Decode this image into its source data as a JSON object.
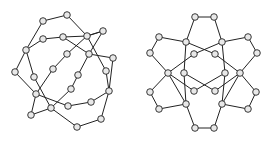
{
  "diagrams": [
    {
      "name": "left-graph",
      "nodes": [
        [
          43,
          21
        ],
        [
          67,
          15
        ],
        [
          87,
          36
        ],
        [
          103,
          31
        ],
        [
          43,
          39
        ],
        [
          63,
          37
        ],
        [
          26,
          50
        ],
        [
          67,
          54
        ],
        [
          89,
          54
        ],
        [
          113,
          58
        ],
        [
          15,
          72
        ],
        [
          53,
          69
        ],
        [
          78,
          75
        ],
        [
          106,
          71
        ],
        [
          34,
          77
        ],
        [
          71,
          89
        ],
        [
          109,
          91
        ],
        [
          36,
          94
        ],
        [
          91,
          102
        ],
        [
          68,
          106
        ],
        [
          51,
          108
        ],
        [
          31,
          115
        ],
        [
          101,
          119
        ],
        [
          77,
          127
        ]
      ],
      "edges": [
        [
          0,
          1
        ],
        [
          1,
          2
        ],
        [
          2,
          3
        ],
        [
          0,
          6
        ],
        [
          4,
          5
        ],
        [
          4,
          6
        ],
        [
          5,
          8
        ],
        [
          6,
          10
        ],
        [
          6,
          14
        ],
        [
          10,
          17
        ],
        [
          2,
          7
        ],
        [
          7,
          11
        ],
        [
          11,
          17
        ],
        [
          3,
          8
        ],
        [
          8,
          12
        ],
        [
          12,
          15
        ],
        [
          15,
          20
        ],
        [
          8,
          9
        ],
        [
          9,
          16
        ],
        [
          2,
          13
        ],
        [
          13,
          16
        ],
        [
          14,
          20
        ],
        [
          17,
          19
        ],
        [
          17,
          21
        ],
        [
          21,
          20
        ],
        [
          19,
          18
        ],
        [
          18,
          16
        ],
        [
          16,
          22
        ],
        [
          22,
          23
        ],
        [
          23,
          20
        ],
        [
          3,
          2
        ],
        [
          5,
          2
        ]
      ]
    },
    {
      "name": "right-graph",
      "nodes": [
        [
          195,
          17
        ],
        [
          214,
          17
        ],
        [
          159,
          37
        ],
        [
          186,
          42
        ],
        [
          222,
          42
        ],
        [
          248,
          37
        ],
        [
          150,
          53
        ],
        [
          194,
          54
        ],
        [
          215,
          54
        ],
        [
          257,
          53
        ],
        [
          168,
          73
        ],
        [
          184,
          73
        ],
        [
          225,
          73
        ],
        [
          240,
          73
        ],
        [
          150,
          92
        ],
        [
          194,
          91
        ],
        [
          215,
          91
        ],
        [
          256,
          92
        ],
        [
          159,
          109
        ],
        [
          186,
          104
        ],
        [
          222,
          104
        ],
        [
          248,
          109
        ],
        [
          195,
          128
        ],
        [
          214,
          128
        ]
      ],
      "edges": [
        [
          0,
          1
        ],
        [
          0,
          3
        ],
        [
          1,
          4
        ],
        [
          2,
          3
        ],
        [
          2,
          6
        ],
        [
          6,
          10
        ],
        [
          3,
          8
        ],
        [
          3,
          11
        ],
        [
          4,
          7
        ],
        [
          4,
          12
        ],
        [
          4,
          5
        ],
        [
          5,
          9
        ],
        [
          9,
          13
        ],
        [
          7,
          10
        ],
        [
          8,
          13
        ],
        [
          10,
          14
        ],
        [
          14,
          18
        ],
        [
          18,
          19
        ],
        [
          10,
          19
        ],
        [
          11,
          16
        ],
        [
          12,
          15
        ],
        [
          13,
          20
        ],
        [
          13,
          17
        ],
        [
          17,
          21
        ],
        [
          21,
          20
        ],
        [
          15,
          10
        ],
        [
          16,
          13
        ],
        [
          19,
          22
        ],
        [
          20,
          23
        ],
        [
          22,
          23
        ],
        [
          19,
          11
        ],
        [
          20,
          12
        ]
      ]
    }
  ]
}
